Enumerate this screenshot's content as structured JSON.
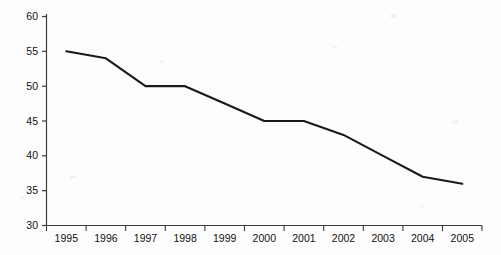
{
  "chart_data": {
    "type": "line",
    "title": "",
    "subtitle": "",
    "xlabel": "",
    "ylabel": "",
    "categories": [
      "1995",
      "1996",
      "1997",
      "1998",
      "1999",
      "2000",
      "2001",
      "2002",
      "2003",
      "2004",
      "2005"
    ],
    "x": [
      1995,
      1996,
      1997,
      1998,
      1999,
      2000,
      2001,
      2002,
      2003,
      2004,
      2005
    ],
    "values": [
      55,
      54,
      50,
      50,
      47.5,
      45,
      45,
      43,
      40,
      37,
      36
    ],
    "series": [
      {
        "name": "",
        "values": [
          55,
          54,
          50,
          50,
          47.5,
          45,
          45,
          43,
          40,
          37,
          36
        ],
        "color": "#1a1a1a",
        "line_width": 2.1
      }
    ],
    "ylim": [
      30,
      60
    ],
    "yticks": [
      30,
      35,
      40,
      45,
      50,
      55,
      60
    ],
    "ytick_labels": [
      "30",
      "35",
      "40",
      "45",
      "50",
      "55",
      "60"
    ],
    "xtick_labels": [
      "1995",
      "1996",
      "1997",
      "1998",
      "1999",
      "2000",
      "2001",
      "2002",
      "2003",
      "2004",
      "2005"
    ],
    "grid": false,
    "legend": null,
    "legend_position": "none",
    "markers": false,
    "axes": {
      "left_spine": true,
      "bottom_spine": true,
      "top_spine": false,
      "right_spine": false,
      "tick_direction": "out",
      "axis_color": "#3c3c3c"
    },
    "annotations": []
  },
  "figure": {
    "background_color": "#fdfdfd",
    "plot_background_color": "#ffffff",
    "width": 501,
    "height": 255
  }
}
